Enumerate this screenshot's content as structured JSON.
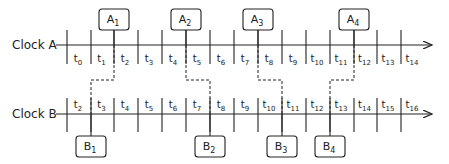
{
  "clocks": [
    {
      "name": "Clock A",
      "axis_y": 45,
      "tick_top": 30,
      "tick_bottom": 64,
      "label_y": 62,
      "ticks_x": [
        67,
        91,
        114,
        138,
        162,
        186,
        210,
        234,
        258,
        282,
        306,
        330,
        354,
        377,
        401
      ],
      "labels": [
        "t0",
        "t1",
        "t2",
        "t3",
        "t4",
        "t5",
        "t6",
        "t7",
        "t8",
        "t9",
        "t10",
        "t11",
        "t12",
        "t13",
        "t14"
      ],
      "label_subs": [
        "0",
        "1",
        "2",
        "3",
        "4",
        "5",
        "6",
        "7",
        "8",
        "9",
        "10",
        "11",
        "12",
        "13",
        "14"
      ]
    },
    {
      "name": "Clock B",
      "axis_y": 114,
      "tick_top": 98,
      "tick_bottom": 132,
      "label_y": 108,
      "ticks_x": [
        67,
        91,
        114,
        138,
        162,
        186,
        210,
        234,
        258,
        282,
        306,
        330,
        354,
        377,
        401
      ],
      "labels": [
        "t2",
        "t3",
        "t4",
        "t5",
        "t6",
        "t7",
        "t8",
        "t9",
        "t10",
        "t11",
        "t12",
        "t13",
        "t14",
        "t15",
        "t16"
      ],
      "label_subs": [
        "2",
        "3",
        "4",
        "5",
        "6",
        "7",
        "8",
        "9",
        "10",
        "11",
        "12",
        "13",
        "14",
        "15",
        "16"
      ]
    }
  ],
  "events_a": [
    {
      "name": "A",
      "sub": "1",
      "x": 114
    },
    {
      "name": "A",
      "sub": "2",
      "x": 186
    },
    {
      "name": "A",
      "sub": "3",
      "x": 258
    },
    {
      "name": "A",
      "sub": "4",
      "x": 354
    }
  ],
  "events_b": [
    {
      "name": "B",
      "sub": "1",
      "x": 91
    },
    {
      "name": "B",
      "sub": "2",
      "x": 210
    },
    {
      "name": "B",
      "sub": "3",
      "x": 282
    },
    {
      "name": "B",
      "sub": "4",
      "x": 330
    }
  ],
  "links": [
    {
      "from_x": 114,
      "to_x": 91
    },
    {
      "from_x": 186,
      "to_x": 210
    },
    {
      "from_x": 258,
      "to_x": 282
    },
    {
      "from_x": 354,
      "to_x": 330
    }
  ],
  "style": {
    "line_color": "#222222",
    "box_fill": "#ffffff"
  }
}
